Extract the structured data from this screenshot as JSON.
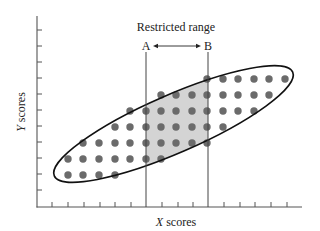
{
  "diagram": {
    "title": "Restricted range",
    "marker_a": "A",
    "marker_b": "B",
    "x_axis_label_var": "X",
    "x_axis_label_rest": " scores",
    "y_axis_label_var": "Y",
    "y_axis_label_rest": " scores",
    "colors": {
      "axis": "#555555",
      "dot": "#6b6b6b",
      "shade": "#d4d4d4",
      "ellipse": "#111111"
    },
    "x_ticks": [
      52,
      68,
      84,
      100,
      115,
      131,
      162,
      178,
      193,
      224,
      240,
      255,
      271,
      287
    ],
    "y_ticks": [
      30,
      46,
      62,
      78,
      94,
      110,
      126,
      142,
      158,
      174,
      190
    ],
    "line_a_x": 146,
    "line_b_x": 208,
    "dot_rows": [
      {
        "y": 79,
        "xs": [
          207,
          223,
          238,
          254,
          269,
          285
        ]
      },
      {
        "y": 95,
        "xs": [
          161,
          176,
          192,
          207,
          223,
          238,
          254,
          269
        ]
      },
      {
        "y": 111,
        "xs": [
          130,
          146,
          161,
          176,
          192,
          207,
          223,
          238,
          254
        ]
      },
      {
        "y": 127,
        "xs": [
          115,
          130,
          146,
          161,
          176,
          192,
          207,
          223
        ]
      },
      {
        "y": 143,
        "xs": [
          83,
          99,
          115,
          130,
          146,
          161,
          176,
          192,
          207
        ]
      },
      {
        "y": 159,
        "xs": [
          68,
          83,
          99,
          115,
          130,
          146,
          161
        ]
      },
      {
        "y": 175,
        "xs": [
          68,
          83,
          99,
          115
        ]
      }
    ]
  }
}
